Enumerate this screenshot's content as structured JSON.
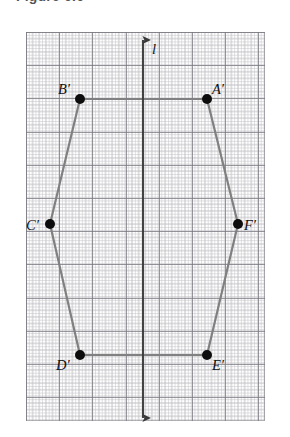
{
  "figure": {
    "heading": "Figure 6.6",
    "caption_visible": false
  },
  "line_of_symmetry": {
    "label": "l",
    "name": "line-l",
    "orientation": "vertical",
    "x_px": 143,
    "top_px": 40,
    "bottom_px": 418,
    "color": "#3a3a3a",
    "arrowheads": "both"
  },
  "grid": {
    "left_px": 26,
    "top_px": 32,
    "width_px": 239,
    "height_px": 389,
    "major_spacing_px": 33.2,
    "minor_spacing_px": 6.64,
    "minor_color": "#8c8c94",
    "major_color": "#74747c",
    "style": "dotted"
  },
  "polygon": {
    "name": "hexagon-a-prime-f-prime",
    "edge_color": "#808080",
    "edge_width_px": 2.2,
    "vertex_color": "#0d0d0d",
    "vertex_radius_px": 5,
    "vertices": [
      {
        "id": "A-prime",
        "label": "A′",
        "x": 207,
        "y": 99,
        "label_x": 212,
        "label_y": 82,
        "label_anchor": "left"
      },
      {
        "id": "B-prime",
        "label": "B′",
        "x": 80,
        "y": 99,
        "label_x": 58,
        "label_y": 82,
        "label_anchor": "left"
      },
      {
        "id": "C-prime",
        "label": "C′",
        "x": 50,
        "y": 224,
        "label_x": 26,
        "label_y": 218,
        "label_anchor": "left"
      },
      {
        "id": "D-prime",
        "label": "D′",
        "x": 80,
        "y": 355,
        "label_x": 56,
        "label_y": 358,
        "label_anchor": "left"
      },
      {
        "id": "E-prime",
        "label": "E′",
        "x": 207,
        "y": 355,
        "label_x": 212,
        "label_y": 358,
        "label_anchor": "left"
      },
      {
        "id": "F-prime",
        "label": "F′",
        "x": 238,
        "y": 224,
        "label_x": 244,
        "label_y": 218,
        "label_anchor": "left"
      }
    ],
    "edges": [
      [
        "B-prime",
        "A-prime"
      ],
      [
        "A-prime",
        "F-prime"
      ],
      [
        "F-prime",
        "E-prime"
      ],
      [
        "E-prime",
        "D-prime"
      ],
      [
        "D-prime",
        "C-prime"
      ],
      [
        "C-prime",
        "B-prime"
      ]
    ]
  }
}
